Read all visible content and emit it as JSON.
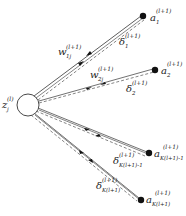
{
  "diagram": {
    "type": "neural-network-backprop-fanout",
    "colors": {
      "line": "#333333",
      "node": "#111111",
      "background": "#ffffff"
    },
    "source_node": {
      "label": "z",
      "sub": "j",
      "sup": "(l)"
    },
    "target_nodes": [
      {
        "label": "a",
        "sub": "1",
        "sup": "(l+1)"
      },
      {
        "label": "a",
        "sub": "2",
        "sup": "(l+1)"
      },
      {
        "label": "a",
        "sub": "K(l+1)-1",
        "sup": "(l+1)"
      },
      {
        "label": "a",
        "sub": "K(l+1)",
        "sup": "(l+1)"
      }
    ],
    "weights": [
      {
        "label": "w",
        "sub": "1j",
        "sup": "(l+1)"
      },
      {
        "label": "w",
        "sub": "2j",
        "sup": "(l+1)"
      }
    ],
    "deltas": [
      {
        "label": "δ",
        "sub": "1",
        "sup": "(l+1)"
      },
      {
        "label": "δ",
        "sub": "2",
        "sup": "(l+1)"
      },
      {
        "label": "δ",
        "sub": "K(l+1)-1",
        "sup": "(l+1)"
      },
      {
        "label": "δ",
        "sub": "K(l+1)",
        "sup": "(l+1)"
      }
    ]
  }
}
